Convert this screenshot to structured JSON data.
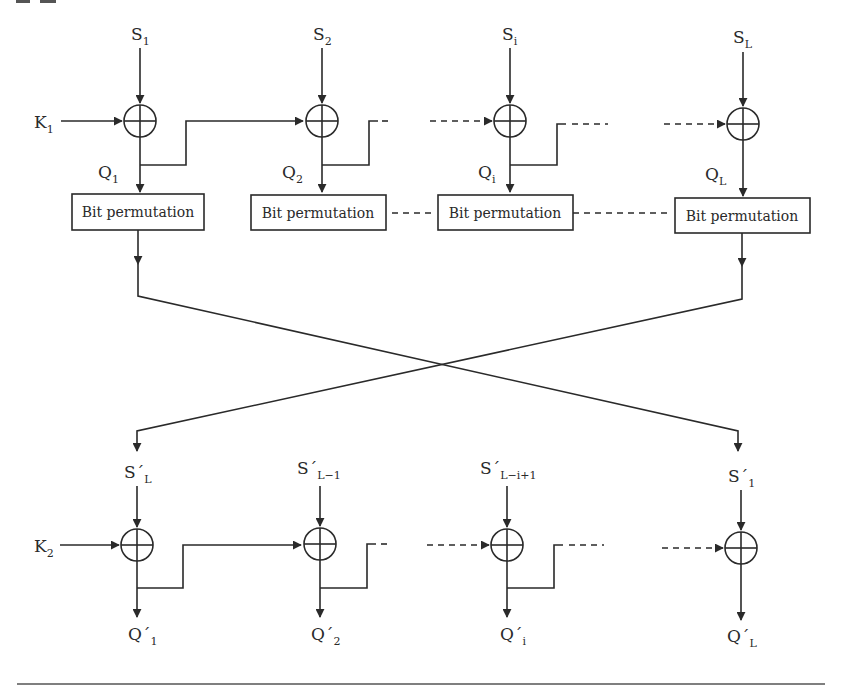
{
  "diagram": {
    "top_row": {
      "key_input": {
        "base": "K",
        "sub": "1"
      },
      "stages": [
        {
          "input": {
            "base": "S",
            "sub": "1"
          },
          "output": {
            "base": "Q",
            "sub": "1"
          },
          "block_label": "Bit permutation"
        },
        {
          "input": {
            "base": "S",
            "sub": "2"
          },
          "output": {
            "base": "Q",
            "sub": "2"
          },
          "block_label": "Bit permutation"
        },
        {
          "input": {
            "base": "S",
            "sub": "i"
          },
          "output": {
            "base": "Q",
            "sub": "i"
          },
          "block_label": "Bit permutation"
        },
        {
          "input": {
            "base": "S",
            "sub": "L"
          },
          "output": {
            "base": "Q",
            "sub": "L"
          },
          "block_label": "Bit permutation"
        }
      ]
    },
    "bottom_row": {
      "key_input": {
        "base": "K",
        "sub": "2"
      },
      "stages": [
        {
          "input": {
            "base": "S´",
            "sub": "L"
          },
          "output": {
            "base": "Q´",
            "sub": "1"
          }
        },
        {
          "input": {
            "base": "S´",
            "sub": "L−1"
          },
          "output": {
            "base": "Q´",
            "sub": "2"
          }
        },
        {
          "input": {
            "base": "S´",
            "sub": "L−i+1"
          },
          "output": {
            "base": "Q´",
            "sub": "i"
          }
        },
        {
          "input": {
            "base": "S´",
            "sub": "1"
          },
          "output": {
            "base": "Q´",
            "sub": "L"
          }
        }
      ]
    },
    "operator_symbol": "xor-circle",
    "line_color": "#2a2a2a",
    "background": "#ffffff"
  }
}
